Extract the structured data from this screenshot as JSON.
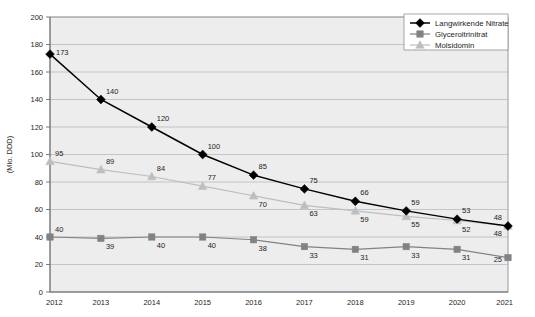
{
  "chart_data": {
    "type": "line",
    "title": "",
    "xlabel": "",
    "ylabel": "(Mio. DDD)",
    "categories": [
      "2012",
      "2013",
      "2014",
      "2015",
      "2016",
      "2017",
      "2018",
      "2019",
      "2020",
      "2021"
    ],
    "x": [
      2012,
      2013,
      2014,
      2015,
      2016,
      2017,
      2018,
      2019,
      2020,
      2021
    ],
    "ylim": [
      0,
      200
    ],
    "ytick_step": 20,
    "yticks": [
      0,
      20,
      40,
      60,
      80,
      100,
      120,
      140,
      160,
      180,
      200
    ],
    "grid": true,
    "legend_position": "top-right",
    "series": [
      {
        "name": "Langwirkende Nitrate",
        "marker": "diamond",
        "color": "#000000",
        "values": [
          173,
          140,
          120,
          100,
          85,
          75,
          66,
          59,
          53,
          48
        ],
        "labels": [
          "173",
          "140",
          "120",
          "100",
          "85",
          "75",
          "66",
          "59",
          "53",
          "48"
        ]
      },
      {
        "name": "Glyceroltrinitrat",
        "marker": "square",
        "color": "#808285",
        "values": [
          40,
          39,
          40,
          40,
          38,
          33,
          31,
          33,
          31,
          25
        ],
        "labels": [
          "40",
          "39",
          "40",
          "40",
          "38",
          "33",
          "31",
          "33",
          "31",
          "25"
        ]
      },
      {
        "name": "Molsidomin",
        "marker": "triangle",
        "color": "#bcbec0",
        "values": [
          95,
          89,
          84,
          77,
          70,
          63,
          59,
          55,
          52,
          48
        ],
        "labels": [
          "95",
          "89",
          "84",
          "77",
          "70",
          "63",
          "59",
          "55",
          "52",
          "48"
        ]
      }
    ]
  },
  "axis": {
    "y_title": "(Mio. DDD)",
    "y_ticks": [
      "200",
      "180",
      "160",
      "140",
      "120",
      "100",
      "80",
      "60",
      "40",
      "20",
      "0"
    ],
    "x_ticks": [
      "2012",
      "2013",
      "2014",
      "2015",
      "2016",
      "2017",
      "2018",
      "2019",
      "2020",
      "2021"
    ]
  },
  "legend": {
    "items": [
      {
        "label": "Langwirkende Nitrate",
        "marker": "diamond-icon",
        "color": "#000000"
      },
      {
        "label": "Glyceroltrinitrat",
        "marker": "square-icon",
        "color": "#808285"
      },
      {
        "label": "Molsidomin",
        "marker": "triangle-icon",
        "color": "#bcbec0"
      }
    ]
  }
}
